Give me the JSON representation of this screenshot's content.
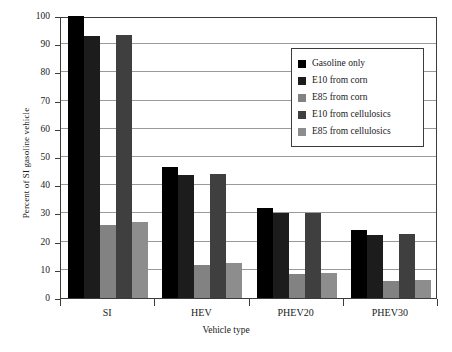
{
  "chart_data": {
    "type": "bar",
    "title": "",
    "xlabel": "Vehicle type",
    "ylabel": "Percent of SI gasoline vehicle",
    "categories": [
      "SI",
      "HEV",
      "PHEV20",
      "PHEV30"
    ],
    "ylim": [
      0,
      100
    ],
    "yticks": [
      0,
      10,
      20,
      30,
      40,
      50,
      60,
      70,
      80,
      90,
      100
    ],
    "ytick_labels": [
      "0",
      "10",
      "20",
      "30",
      "40",
      "50",
      "60",
      "70",
      "80",
      "90",
      "100"
    ],
    "grid": true,
    "legend_position": "upper right",
    "series": [
      {
        "name": "Gasoline only",
        "color": "#000000",
        "values": [
          100,
          46.5,
          32.0,
          24.0
        ]
      },
      {
        "name": "E10 from corn",
        "color": "#1c1c1c",
        "values": [
          93.0,
          43.5,
          30.0,
          22.5
        ]
      },
      {
        "name": "E85 from corn",
        "color": "#828282",
        "values": [
          25.8,
          11.8,
          8.4,
          6.0
        ]
      },
      {
        "name": "E10 from cellulosics",
        "color": "#3f3f3f",
        "values": [
          93.2,
          44.0,
          30.2,
          22.6
        ]
      },
      {
        "name": "E85 from cellulosics",
        "color": "#8d8d8d",
        "values": [
          27.0,
          12.4,
          8.7,
          6.5
        ]
      }
    ]
  },
  "axes": {
    "y_title": "Percent of SI gasoline vehicle",
    "x_title": "Vehicle type"
  }
}
